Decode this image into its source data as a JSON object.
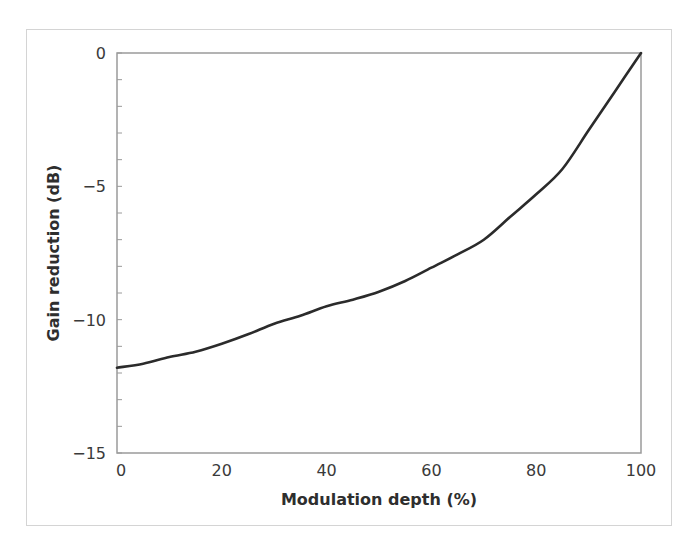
{
  "chart_data": {
    "type": "line",
    "title": "",
    "xlabel": "Modulation depth (%)",
    "ylabel": "Gain reduction (dB)",
    "xlim": [
      0,
      100
    ],
    "ylim": [
      -15,
      0
    ],
    "x_ticks": [
      0,
      20,
      40,
      60,
      80,
      100
    ],
    "x_tick_labels": [
      "0",
      "20",
      "40",
      "60",
      "80",
      "100"
    ],
    "y_ticks": [
      0,
      -5,
      -10,
      -15
    ],
    "y_tick_labels": [
      "0",
      "−5",
      "−10",
      "−15"
    ],
    "y_minor_tick_step": 1,
    "grid": false,
    "legend": null,
    "series": [
      {
        "name": "Gain reduction",
        "color": "#2b2b2b",
        "x": [
          0,
          5,
          10,
          15,
          20,
          25,
          30,
          35,
          40,
          45,
          50,
          55,
          60,
          65,
          70,
          75,
          80,
          85,
          90,
          95,
          100
        ],
        "y": [
          -11.8,
          -11.65,
          -11.4,
          -11.2,
          -10.9,
          -10.55,
          -10.15,
          -9.85,
          -9.5,
          -9.25,
          -8.95,
          -8.55,
          -8.05,
          -7.55,
          -7.0,
          -6.15,
          -5.3,
          -4.35,
          -2.9,
          -1.45,
          0
        ]
      }
    ]
  },
  "colors": {
    "axis_frame": "#9a9a9a",
    "figure_border": "#d4d4d4",
    "line": "#2b2b2b",
    "text": "#3a3a3a"
  }
}
